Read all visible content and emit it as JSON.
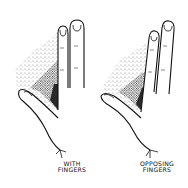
{
  "illustration": {
    "style": "black ink line drawing with stipple shading",
    "panels": [
      {
        "id": "left",
        "subject": "hand with index and middle fingers raised side by side, thumb extended",
        "caption_lines": [
          "WITH",
          "FINGERS"
        ]
      },
      {
        "id": "right",
        "subject": "hand with index and middle fingers raised, slightly tilted, thumb extended",
        "caption_lines": [
          "OPPOSING",
          "FINGERS"
        ]
      }
    ]
  },
  "colors": {
    "ink": "#111111",
    "background": "#ffffff"
  }
}
